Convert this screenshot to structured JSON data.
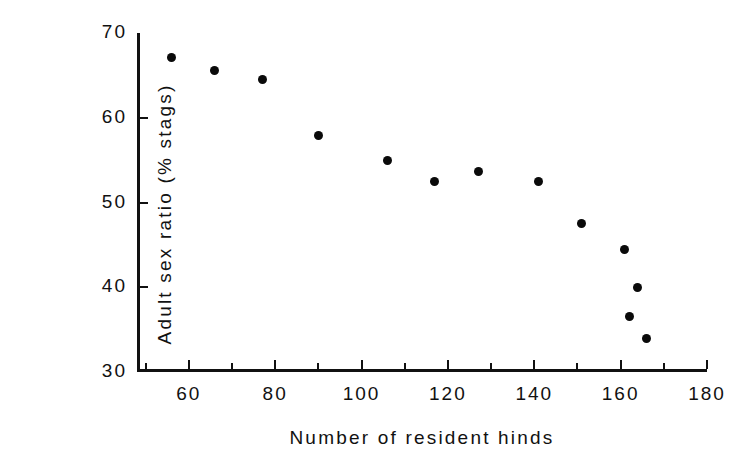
{
  "chart_data": {
    "type": "scatter",
    "title": "",
    "xlabel": "Number of resident hinds",
    "ylabel": "Adult sex ratio (% stags)",
    "xlim": [
      48,
      180
    ],
    "ylim": [
      30,
      70
    ],
    "grid": false,
    "legend": "none",
    "marker": "filled-circle",
    "marker_color": "#0a0a0a",
    "x_ticks": [
      60,
      80,
      100,
      120,
      140,
      160,
      180
    ],
    "x_minor_ticks": [
      50,
      70,
      90,
      110,
      130,
      150,
      170
    ],
    "y_ticks": [
      30,
      40,
      50,
      60,
      70
    ],
    "x": [
      56,
      66,
      77,
      90,
      106,
      117,
      127,
      141,
      151,
      161,
      164,
      162,
      166
    ],
    "y": [
      67.1,
      65.6,
      64.5,
      57.9,
      55.0,
      52.5,
      53.6,
      52.5,
      47.5,
      44.5,
      40.0,
      36.5,
      34.0
    ],
    "points": [
      {
        "x": 56,
        "y": 67.1
      },
      {
        "x": 66,
        "y": 65.6
      },
      {
        "x": 77,
        "y": 64.5
      },
      {
        "x": 90,
        "y": 57.9
      },
      {
        "x": 106,
        "y": 55.0
      },
      {
        "x": 117,
        "y": 52.5
      },
      {
        "x": 127,
        "y": 53.6
      },
      {
        "x": 141,
        "y": 52.5
      },
      {
        "x": 151,
        "y": 47.5
      },
      {
        "x": 161,
        "y": 44.5
      },
      {
        "x": 164,
        "y": 40.0
      },
      {
        "x": 162,
        "y": 36.5
      },
      {
        "x": 166,
        "y": 34.0
      }
    ]
  }
}
